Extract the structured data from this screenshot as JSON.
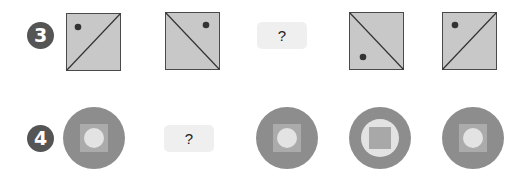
{
  "rows": [
    {
      "number": "3",
      "items": [
        {
          "type": "square",
          "diagonal": "bottom-left-to-top-right",
          "dot": "top-left"
        },
        {
          "type": "square",
          "diagonal": "top-left-to-bottom-right",
          "dot": "top-right"
        },
        {
          "type": "question",
          "label": "?"
        },
        {
          "type": "square",
          "diagonal": "top-left-to-bottom-right",
          "dot": "bottom-left"
        },
        {
          "type": "square",
          "diagonal": "bottom-left-to-top-right",
          "dot": "top-left"
        }
      ]
    },
    {
      "number": "4",
      "items": [
        {
          "type": "circle",
          "inner": "square-with-circle"
        },
        {
          "type": "question",
          "label": "?"
        },
        {
          "type": "circle",
          "inner": "square-with-circle"
        },
        {
          "type": "circle",
          "inner": "circle-with-square"
        },
        {
          "type": "circle",
          "inner": "square-with-circle"
        }
      ]
    }
  ],
  "colors": {
    "badge": "#555555",
    "square_fill": "#c8c8c8",
    "square_stroke": "#4a4a4a",
    "dot": "#333333",
    "question_bg": "#efefef",
    "circle_outer": "#8d8d8d",
    "circle_inner_square": "#ababab",
    "circle_inner_light": "#e3e3e3"
  }
}
